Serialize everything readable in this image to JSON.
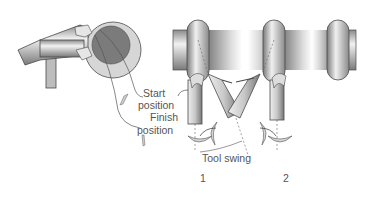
{
  "figure": {
    "labels": {
      "start_line1": "Start",
      "start_line2": "position",
      "finish_line1": "Finish",
      "finish_line2": "position",
      "tool_swing": "Tool swing",
      "station_1": "1",
      "station_2": "2"
    },
    "colors": {
      "outline": "#4a4a4a",
      "light_gray": "#d9d9d9",
      "mid_gray": "#a8a8a8",
      "dark_gray": "#6f6f6f",
      "workpiece_disc_outer": "#cfcfcf",
      "workpiece_disc_inner": "#7a7a7a",
      "text": "#555555",
      "background": "#ffffff"
    }
  }
}
